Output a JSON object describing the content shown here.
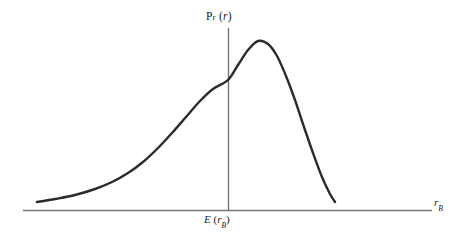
{
  "figure": {
    "background_color": "#ffffff",
    "curve_color": "#2b2b2b",
    "axis_color": "#777777",
    "vaxis_color": "#6e6e6e"
  },
  "labels": {
    "y_axis": {
      "full": "Pr (r)",
      "prefix_cap": "P",
      "prefix_smallcap": "r",
      "open_paren": " (",
      "variable": "r",
      "close_paren": ")"
    },
    "x_tick": {
      "full": "E (rB)",
      "operator": "E",
      "open_paren": " (",
      "variable": "r",
      "subscript": "B",
      "close_paren": ")"
    },
    "x_axis": {
      "full": "rB",
      "variable": "r",
      "subscript": "B"
    }
  },
  "chart_data": {
    "type": "line",
    "title": "",
    "xlabel": "rB",
    "ylabel": "Pr (r)",
    "grid": false,
    "legend": null,
    "annotations": [
      {
        "text": "E (rB)",
        "x": 228,
        "y": 210,
        "role": "x-axis-tick-expected-return"
      }
    ],
    "axes": {
      "x_axis_line": {
        "x_start": 23,
        "x_end": 432,
        "y": 210
      },
      "y_axis_line": {
        "x": 228,
        "y_start": 28,
        "y_end": 210
      }
    },
    "series": [
      {
        "name": "Pr (r)",
        "points_px": [
          [
            37,
            202
          ],
          [
            55,
            199
          ],
          [
            75,
            195
          ],
          [
            95,
            189
          ],
          [
            112,
            182
          ],
          [
            128,
            173
          ],
          [
            143,
            162
          ],
          [
            158,
            148
          ],
          [
            172,
            133
          ],
          [
            186,
            117
          ],
          [
            200,
            101
          ],
          [
            213,
            89
          ],
          [
            228,
            80
          ],
          [
            238,
            65
          ],
          [
            248,
            50
          ],
          [
            258,
            41
          ],
          [
            268,
            44
          ],
          [
            277,
            56
          ],
          [
            286,
            76
          ],
          [
            295,
            100
          ],
          [
            304,
            127
          ],
          [
            313,
            153
          ],
          [
            322,
            177
          ],
          [
            330,
            194
          ],
          [
            335,
            202
          ]
        ],
        "peak_px": [
          258,
          41
        ],
        "axis_crossing_px": [
          228,
          80
        ],
        "start_px": [
          37,
          202
        ],
        "end_px": [
          335,
          202
        ]
      }
    ],
    "normalized_curve": {
      "x": [
        0.0,
        0.06,
        0.13,
        0.19,
        0.25,
        0.31,
        0.36,
        0.41,
        0.45,
        0.5,
        0.55,
        0.59,
        0.64,
        0.67,
        0.71,
        0.74,
        0.77,
        0.8,
        0.83,
        0.86,
        0.89,
        0.92,
        0.95,
        0.98,
        1.0
      ],
      "y": [
        0.0,
        0.02,
        0.04,
        0.08,
        0.12,
        0.18,
        0.25,
        0.33,
        0.43,
        0.53,
        0.63,
        0.7,
        0.76,
        0.85,
        0.94,
        1.0,
        0.98,
        0.91,
        0.78,
        0.63,
        0.47,
        0.3,
        0.16,
        0.05,
        0.0
      ]
    }
  }
}
